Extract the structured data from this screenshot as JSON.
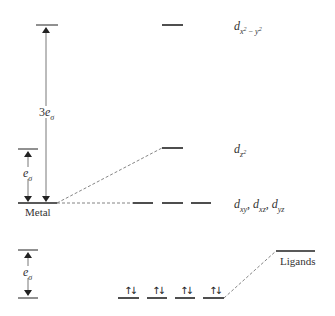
{
  "diagram": {
    "type": "molecular-orbital-energy-level-diagram",
    "labels": {
      "metal": "Metal",
      "ligands": "Ligands",
      "three_e_sigma_coef": "3",
      "e": "e",
      "sigma": "σ",
      "d": "d",
      "dx2y2_sub_x": "x",
      "dx2y2_sub_sup1": "2",
      "dx2y2_sub_minus": " − ",
      "dx2y2_sub_y": "y",
      "dx2y2_sub_sup2": "2",
      "dz2_sub": "z",
      "dz2_sup": "2",
      "dxy_sub": "xy",
      "dxz_sub": "xz",
      "dyz_sub": "yz",
      "comma": ", "
    },
    "levels": [
      {
        "name": "d_x2-y2",
        "relative_energy": "3eσ above metal"
      },
      {
        "name": "d_z2",
        "relative_energy": "eσ above metal"
      },
      {
        "name": "d_xy, d_xz, d_yz",
        "relative_energy": "metal level (nonbonding)"
      },
      {
        "name": "bonding (4 levels, filled)",
        "relative_energy": "eσ below ligands",
        "electrons": "↑↓ each"
      },
      {
        "name": "Ligands",
        "relative_energy": "ligand level"
      }
    ],
    "spin_pair": "↑↓",
    "colors": {
      "line": "#222222",
      "dashed": "#555555"
    }
  }
}
